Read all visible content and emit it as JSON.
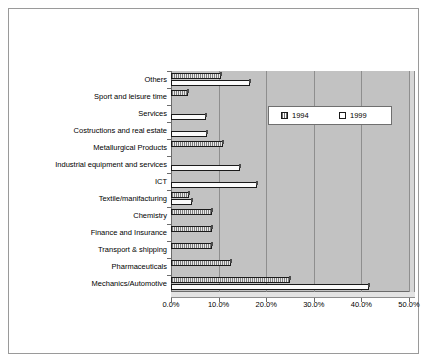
{
  "chart_data": {
    "type": "bar",
    "orientation": "horizontal",
    "title": "",
    "xlabel": "",
    "ylabel": "",
    "xlim": [
      0,
      50
    ],
    "xticks": [
      0,
      10,
      20,
      30,
      40,
      50
    ],
    "xtick_labels": [
      "0.0%",
      "10.0%",
      "20.0%",
      "30.0%",
      "40.0%",
      "50.0%"
    ],
    "grid": true,
    "legend_position": "upper-right-inside",
    "categories": [
      "Mechanics/Automotive",
      "Pharmaceuticals",
      "Transport & shipping",
      "Finance and Insurance",
      "Chemistry",
      "Textile/manifacturing",
      "ICT",
      "Industrial equipment and services",
      "Metallurgical Products",
      "Costructions and real estate",
      "Services",
      "Sport and leisure time",
      "Others"
    ],
    "series": [
      {
        "name": "1994",
        "values": [
          25.0,
          12.7,
          8.7,
          8.7,
          8.7,
          3.8,
          0.0,
          0.0,
          11.0,
          0.0,
          0.0,
          3.5,
          10.5
        ]
      },
      {
        "name": "1999",
        "values": [
          41.5,
          0.0,
          0.0,
          0.0,
          0.0,
          4.5,
          18.0,
          14.5,
          0.0,
          7.5,
          7.3,
          0.0,
          16.5
        ]
      }
    ]
  },
  "legend": {
    "entries": [
      {
        "label": "1994",
        "swatch": "hatched-swatch"
      },
      {
        "label": "1999",
        "swatch": "empty-swatch"
      }
    ]
  },
  "colors": {
    "plot_background": "#c2c2c2",
    "series_1994": "#7d7d7d",
    "series_1999": "#fbfbfb",
    "gridline": "#8e8e8e",
    "axis": "#6b6b6b",
    "frame": "#9a9a9a"
  }
}
